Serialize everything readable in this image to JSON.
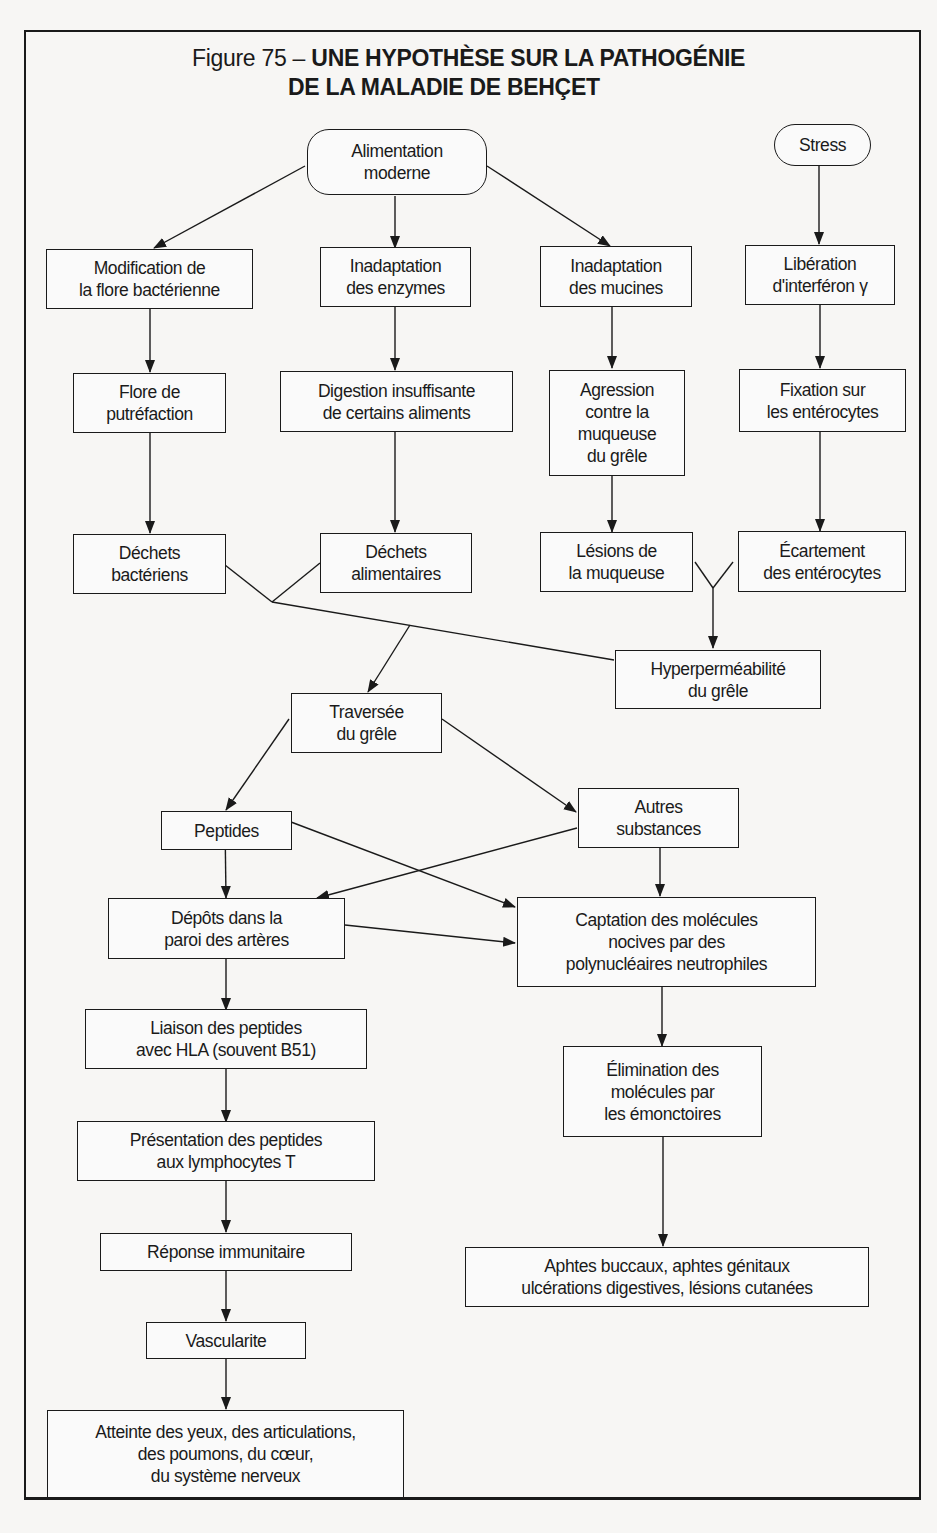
{
  "figure": {
    "number_label": "Figure 75 –",
    "title_line1": "UNE HYPOTHÈSE SUR LA PATHOGÉNIE",
    "title_line2": "DE LA MALADIE DE BEHÇET"
  },
  "nodes": {
    "alimentation": "Alimentation\nmoderne",
    "stress": "Stress",
    "modif_flore": "Modification de\nla flore bactérienne",
    "inadapt_enzymes": "Inadaptation\ndes enzymes",
    "inadapt_mucines": "Inadaptation\ndes mucines",
    "liberation_interferon": "Libération\nd'interféron γ",
    "flore_putrefaction": "Flore de\nputréfaction",
    "digestion": "Digestion insuffisante\nde certains aliments",
    "agression": "Agression\ncontre la\nmuqueuse\ndu grêle",
    "fixation": "Fixation sur\nles entérocytes",
    "dechets_bact": "Déchets\nbactériens",
    "dechets_alim": "Déchets\nalimentaires",
    "lesions_muqueuse": "Lésions de\nla muqueuse",
    "ecartement": "Écartement\ndes entérocytes",
    "hyperpermeabilite": "Hyperperméabilité\ndu grêle",
    "traversee": "Traversée\ndu grêle",
    "peptides": "Peptides",
    "autres_substances": "Autres\nsubstances",
    "depots": "Dépôts dans la\nparoi des artères",
    "captation": "Captation des molécules\nnocives par des\npolynucléaires neutrophiles",
    "liaison": "Liaison des peptides\navec HLA (souvent B51)",
    "elimination": "Élimination des\nmolécules par\nles émonctoires",
    "presentation": "Présentation des peptides\naux lymphocytes T",
    "reponse": "Réponse immunitaire",
    "aphtes": "Aphtes buccaux, aphtes génitaux\nulcérations digestives, lésions cutanées",
    "vascularite": "Vascularite",
    "atteinte": "Atteinte des yeux, des articulations,\ndes poumons, du cœur,\ndu système nerveux"
  },
  "colors": {
    "ink": "#1a1a1a",
    "paper": "#f7f6f4"
  }
}
